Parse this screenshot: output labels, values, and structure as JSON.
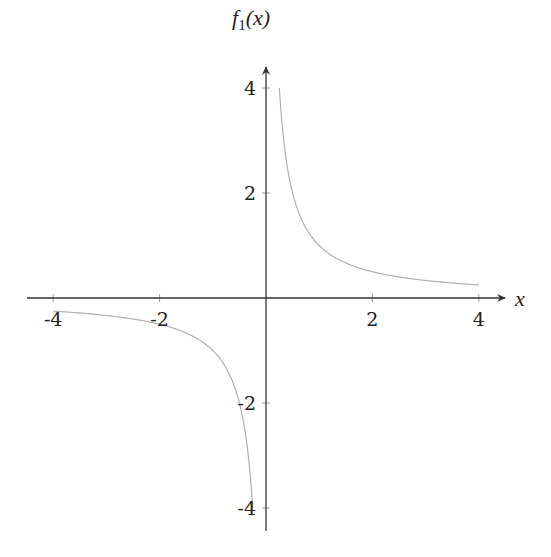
{
  "chart_data": {
    "type": "line",
    "title": "",
    "xlabel": "x",
    "ylabel": "f1(x)",
    "ylabel_parts": {
      "f": "f",
      "sub": "1",
      "arg": "(x)"
    },
    "xlim": [
      -4.5,
      4.5
    ],
    "ylim": [
      -4.5,
      4.5
    ],
    "grid": false,
    "legend": null,
    "x_ticks": [
      -4,
      -2,
      2,
      4
    ],
    "x_tick_labels": [
      "-4",
      "-2",
      "2",
      "4"
    ],
    "y_ticks": [
      -4,
      -2,
      2,
      4
    ],
    "y_tick_labels": [
      "-4",
      "-2",
      "2",
      "4"
    ],
    "series": [
      {
        "name": "f1(x) = 1/x",
        "color": "#b0b0b0",
        "branches": [
          {
            "x_range": [
              -4,
              -0.25
            ]
          },
          {
            "x_range": [
              0.25,
              4
            ]
          }
        ],
        "x": [
          -4,
          -3,
          -2,
          -1,
          -0.5,
          -0.25,
          0.25,
          0.5,
          1,
          2,
          3,
          4
        ],
        "y": [
          -0.25,
          -0.333,
          -0.5,
          -1,
          -2,
          -4,
          4,
          2,
          1,
          0.5,
          0.333,
          0.25
        ]
      }
    ]
  }
}
